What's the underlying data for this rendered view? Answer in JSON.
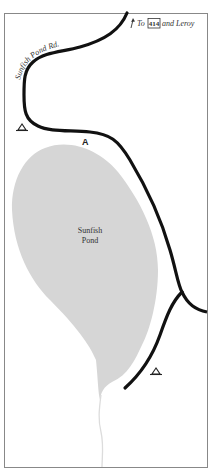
{
  "map": {
    "title": "Sunfish Pond area",
    "colors": {
      "background": "#ffffff",
      "frame": "#777777",
      "road": "#111111",
      "pond": "#d6d6d6",
      "stream": "#dddddd",
      "text": "#333333"
    },
    "labels": {
      "road_name": "Sunfish Pond Rd.",
      "direction_prefix": "To",
      "route_shield": "414",
      "direction_suffix": "and Leroy",
      "point_marker": "A",
      "pond_name_line1": "Sunfish",
      "pond_name_line2": "Pond"
    },
    "icons": {
      "direction_arrow": "north-arrow-icon",
      "campsite_1": "campsite-triangle-icon",
      "campsite_2": "campsite-triangle-icon"
    }
  }
}
